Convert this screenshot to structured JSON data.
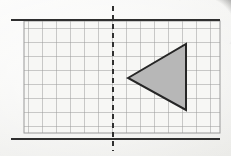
{
  "page": {
    "background_color": "#f4f4f2"
  },
  "figure": {
    "name": "reflection-grid-figure",
    "grid": {
      "name": "square-grid",
      "columns": 14,
      "rows": 8,
      "cell_size": 14,
      "origin_x": 24,
      "origin_y": 21,
      "line_color": "#9a9a9a",
      "line_width": 1,
      "cell_fill": "#f7f7f5"
    },
    "top_rule": {
      "name": "top-border-rule",
      "x1": 12,
      "x2": 219,
      "y": 20,
      "color": "#2f2f2f",
      "width": 2
    },
    "bottom_rule": {
      "name": "bottom-border-rule",
      "x1": 12,
      "x2": 219,
      "y": 139,
      "color": "#2f2f2f",
      "width": 2
    },
    "mirror_line": {
      "name": "mirror-line",
      "label": "line of reflection",
      "orientation": "vertical",
      "x": 113,
      "y1": 6,
      "y2": 151,
      "color": "#303030",
      "width": 2,
      "dash": "5 4"
    },
    "triangle": {
      "name": "shaded-triangle",
      "label": "triangle",
      "direction": "points-left",
      "fill": "#b7b7b7",
      "stroke": "#262626",
      "stroke_width": 2,
      "points": "128,78 186,44 186,110",
      "vertices": [
        {
          "name": "apex-left",
          "x": 128,
          "y": 78
        },
        {
          "name": "top-right",
          "x": 186,
          "y": 44
        },
        {
          "name": "bottom-right",
          "x": 186,
          "y": 110
        }
      ]
    }
  }
}
